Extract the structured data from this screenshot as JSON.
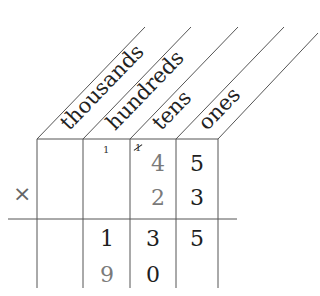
{
  "diagram": {
    "type": "place-value multiplication grid",
    "columns": [
      {
        "key": "thousands",
        "label": "thousands"
      },
      {
        "key": "hundreds",
        "label": "hundreds"
      },
      {
        "key": "tens",
        "label": "tens"
      },
      {
        "key": "ones",
        "label": "ones"
      }
    ],
    "operator": "×",
    "carries": {
      "hundreds": "1",
      "tens": "1"
    },
    "rows": {
      "multiplicand": {
        "thousands": "",
        "hundreds": "",
        "tens": "4",
        "ones": "5"
      },
      "multiplier": {
        "thousands": "",
        "hundreds": "",
        "tens": "2",
        "ones": "3"
      },
      "partial_1": {
        "thousands": "",
        "hundreds": "1",
        "tens": "3",
        "ones": "5"
      },
      "partial_2": {
        "thousands": "",
        "hundreds": "9",
        "tens": "0",
        "ones": ""
      }
    },
    "colors": {
      "line": "#555555",
      "dark_digit": "#1e1e1e",
      "gray_digit": "#7a7a7a",
      "operator": "#666666"
    }
  }
}
